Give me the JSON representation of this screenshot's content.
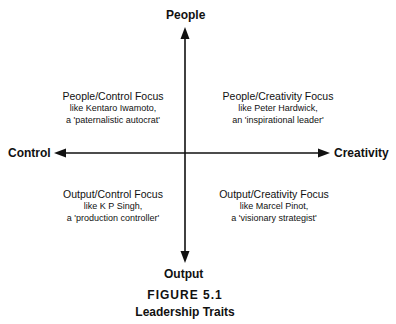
{
  "diagram": {
    "axes": {
      "top": "People",
      "bottom": "Output",
      "left": "Control",
      "right": "Creativity"
    },
    "quadrants": [
      {
        "position": "top-left",
        "title": "People/Control Focus",
        "line1": "like Kentaro Iwamoto,",
        "line2": "a 'paternalistic autocrat'"
      },
      {
        "position": "top-right",
        "title": "People/Creativity Focus",
        "line1": "like Peter Hardwick,",
        "line2": "an 'inspirational leader'"
      },
      {
        "position": "bottom-left",
        "title": "Output/Control Focus",
        "line1": "like K P Singh,",
        "line2": "a 'production controller'"
      },
      {
        "position": "bottom-right",
        "title": "Output/Creativity Focus",
        "line1": "like Marcel Pinot,",
        "line2": "a 'visionary strategist'"
      }
    ]
  },
  "caption": {
    "figure": "FIGURE 5.1",
    "title": "Leadership Traits"
  },
  "colors": {
    "line": "#111111",
    "background": "#ffffff"
  }
}
